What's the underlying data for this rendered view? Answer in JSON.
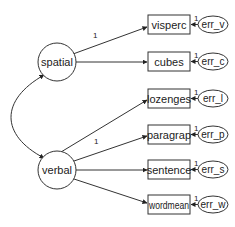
{
  "diagram": {
    "type": "structural-equation-model",
    "colors": {
      "stroke": "#333333",
      "background": "#ffffff",
      "text": "#222222"
    },
    "latent_factors": [
      {
        "id": "spatial",
        "label": "spatial"
      },
      {
        "id": "verbal",
        "label": "verbal"
      }
    ],
    "observed_variables": [
      {
        "id": "visperc",
        "label": "visperc",
        "factor": "spatial",
        "loading_label": "1"
      },
      {
        "id": "cubes",
        "label": "cubes",
        "factor": "spatial",
        "loading_label": ""
      },
      {
        "id": "lozenges",
        "label": "lozenges",
        "factor": "spatial",
        "loading_label": ""
      },
      {
        "id": "paragrap",
        "label": "paragrap",
        "factor": "verbal",
        "loading_label": "1"
      },
      {
        "id": "sentence",
        "label": "sentence",
        "factor": "verbal",
        "loading_label": ""
      },
      {
        "id": "wordmean",
        "label": "wordmean",
        "factor": "verbal",
        "loading_label": ""
      }
    ],
    "error_terms": [
      {
        "id": "err_v",
        "label": "err_v",
        "target": "visperc",
        "weight_label": "1"
      },
      {
        "id": "err_c",
        "label": "err_c",
        "target": "cubes",
        "weight_label": "1"
      },
      {
        "id": "err_l",
        "label": "err_l",
        "target": "lozenges",
        "weight_label": "1"
      },
      {
        "id": "err_p",
        "label": "err_p",
        "target": "paragrap",
        "weight_label": "1"
      },
      {
        "id": "err_s",
        "label": "err_s",
        "target": "sentence",
        "weight_label": "1"
      },
      {
        "id": "err_w",
        "label": "err_w",
        "target": "wordmean",
        "weight_label": "1"
      }
    ],
    "covariances": [
      {
        "between": [
          "spatial",
          "verbal"
        ]
      }
    ]
  }
}
